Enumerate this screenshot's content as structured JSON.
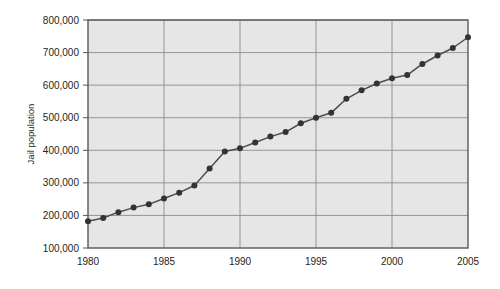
{
  "chart_data": {
    "type": "line",
    "title": "",
    "subtitle": "",
    "xlabel": "",
    "ylabel": "Jail population",
    "xlim": [
      1980,
      2005
    ],
    "ylim": [
      100000,
      800000
    ],
    "grid": true,
    "legend": null,
    "xticks": [
      "1980",
      "1985",
      "1990",
      "1995",
      "2000",
      "2005"
    ],
    "xtick_values": [
      1980,
      1985,
      1990,
      1995,
      2000,
      2005
    ],
    "yticks": [
      "100,000",
      "200,000",
      "300,000",
      "400,000",
      "500,000",
      "600,000",
      "700,000",
      "800,000"
    ],
    "ytick_values": [
      100000,
      200000,
      300000,
      400000,
      500000,
      600000,
      700000,
      800000
    ],
    "x": [
      1980,
      1981,
      1982,
      1983,
      1984,
      1985,
      1986,
      1987,
      1988,
      1989,
      1990,
      1991,
      1992,
      1993,
      1994,
      1995,
      1996,
      1997,
      1998,
      1999,
      2000,
      2001,
      2002,
      2003,
      2004,
      2005
    ],
    "values": [
      182000,
      192000,
      210000,
      224000,
      234000,
      252000,
      270000,
      292000,
      344000,
      396000,
      406000,
      424000,
      442000,
      456000,
      483000,
      500000,
      515000,
      558000,
      584000,
      605000,
      621000,
      631000,
      665000,
      691000,
      714000,
      747000
    ],
    "series": [
      {
        "name": "Jail population",
        "values": [
          182000,
          192000,
          210000,
          224000,
          234000,
          252000,
          270000,
          292000,
          344000,
          396000,
          406000,
          424000,
          442000,
          456000,
          483000,
          500000,
          515000,
          558000,
          584000,
          605000,
          621000,
          631000,
          665000,
          691000,
          714000,
          747000
        ]
      }
    ],
    "colors": {
      "plot_background": "#e6e6e6",
      "grid": "#8c8c8c",
      "frame": "#595959",
      "line": "#4d4d4d",
      "marker": "#333333",
      "text": "#231f20",
      "page_background": "#ffffff"
    },
    "marker": "circle",
    "line_width": 1.4,
    "marker_size": 3
  }
}
